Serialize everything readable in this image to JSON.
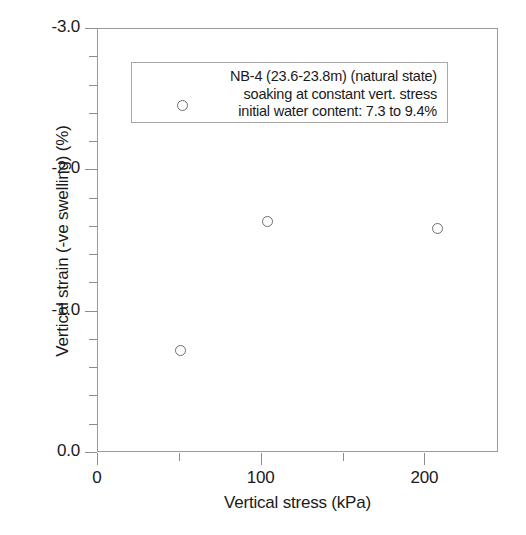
{
  "chart_data": {
    "type": "scatter",
    "title": "",
    "xlabel": "Vertical stress (kPa)",
    "ylabel": "Vertical strain (-ve swelling) (%)",
    "xlim": [
      0,
      245
    ],
    "ylim": [
      0.0,
      -3.0
    ],
    "grid": false,
    "y_axis_inverted": true,
    "xticks_major": [
      {
        "value": 0,
        "label": "0"
      },
      {
        "value": 100,
        "label": "100"
      },
      {
        "value": 200,
        "label": "200"
      }
    ],
    "xticks_minor": [
      50,
      150
    ],
    "yticks_major": [
      {
        "value": -3.0,
        "label": "-3.0"
      },
      {
        "value": -2.0,
        "label": "-2.0"
      },
      {
        "value": -1.0,
        "label": "-1.0"
      },
      {
        "value": 0.0,
        "label": "0.0"
      }
    ],
    "yticks_minor": [
      -2.8,
      -2.6,
      -2.4,
      -2.2,
      -1.8,
      -1.6,
      -1.4,
      -1.2,
      -0.8,
      -0.6,
      -0.4,
      -0.2
    ],
    "series": [
      {
        "name": "NB-4 (23.6-23.8m) (natural state)",
        "marker": "open-circle",
        "marker_color": "#6d6d6d",
        "points": [
          {
            "x": 51,
            "y": -0.72
          },
          {
            "x": 104,
            "y": -1.63
          },
          {
            "x": 208,
            "y": -1.58
          }
        ]
      }
    ],
    "legend": {
      "position": "upper-center",
      "marker": "open-circle",
      "lines": [
        "NB-4 (23.6-23.8m) (natural state)",
        "soaking at constant vert. stress",
        "initial water content: 7.3 to 9.4%"
      ]
    }
  },
  "colors": {
    "axis": "#9a9a9a",
    "tick": "#8d8d8d",
    "text": "#1a1a1a",
    "marker": "#6d6d6d",
    "legend_border": "#a8a8a8",
    "background": "#ffffff"
  }
}
